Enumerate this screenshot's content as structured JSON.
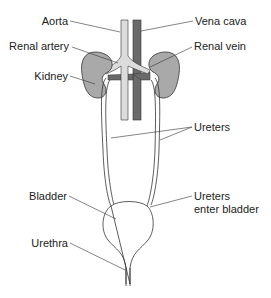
{
  "diagram": {
    "type": "anatomy",
    "labels": {
      "aorta": "Aorta",
      "vena_cava": "Vena cava",
      "renal_artery": "Renal artery",
      "renal_vein": "Renal vein",
      "kidney": "Kidney",
      "ureters": "Ureters",
      "bladder": "Bladder",
      "ureters_enter_line1": "Ureters",
      "ureters_enter_line2": "enter bladder",
      "urethra": "Urethra"
    },
    "colors": {
      "kidney_fill": "#a9a9a9",
      "aorta_fill": "#dcdcdc",
      "vena_cava_fill": "#6a6a6a",
      "outline": "#333333",
      "background": "#ffffff"
    }
  }
}
